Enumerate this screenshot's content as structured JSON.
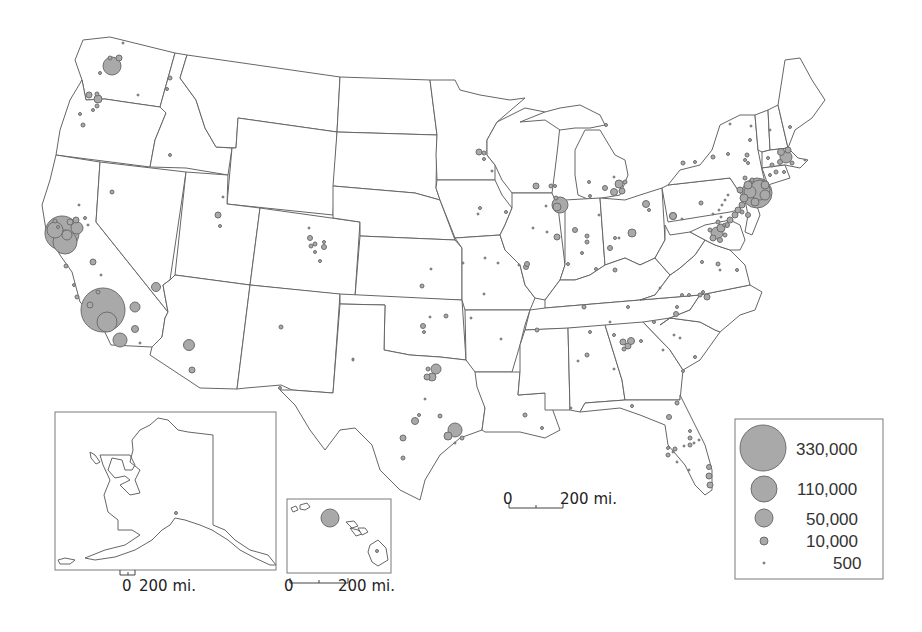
{
  "map": {
    "title": "",
    "subject": "Proportional symbol map of the United States",
    "fill_color": "#a9a9a9",
    "stroke_color": "#666666",
    "background": "#ffffff"
  },
  "legend": {
    "items": [
      {
        "label": "330,000",
        "value": 330000
      },
      {
        "label": "110,000",
        "value": 110000
      },
      {
        "label": "50,000",
        "value": 50000
      },
      {
        "label": "10,000",
        "value": 10000
      },
      {
        "label": "500",
        "value": 500
      }
    ]
  },
  "scale_bars": {
    "main": {
      "zero": "0",
      "distance": "200 mi."
    },
    "alaska": {
      "zero": "0",
      "distance": "200 mi."
    },
    "hawaii": {
      "zero": "0",
      "distance": "200 mi."
    }
  },
  "insets": {
    "alaska": {
      "name": "Alaska"
    },
    "hawaii": {
      "name": "Hawaii"
    }
  }
}
